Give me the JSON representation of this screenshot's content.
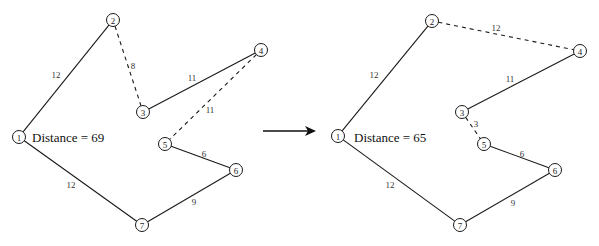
{
  "figure": {
    "width": 599,
    "height": 246,
    "arrow": {
      "x1": 263,
      "y1": 131,
      "x2": 316,
      "y2": 131
    }
  },
  "graphs": [
    {
      "id": "before",
      "distance_label": "Distance = 69",
      "distance_pos": {
        "x": 32,
        "y": 142
      },
      "nodes": [
        {
          "id": "1",
          "label": "1",
          "x": 19,
          "y": 137
        },
        {
          "id": "2",
          "label": "2",
          "x": 113,
          "y": 20
        },
        {
          "id": "3",
          "label": "3",
          "x": 143,
          "y": 112
        },
        {
          "id": "4",
          "label": "4",
          "x": 261,
          "y": 50
        },
        {
          "id": "5",
          "label": "5",
          "x": 165,
          "y": 144
        },
        {
          "id": "6",
          "label": "6",
          "x": 236,
          "y": 170
        },
        {
          "id": "7",
          "label": "7",
          "x": 142,
          "y": 225
        }
      ],
      "edges": [
        {
          "from": "1",
          "to": "2",
          "weight": "12",
          "style": "solid",
          "label_pos": {
            "x": 56,
            "y": 75
          }
        },
        {
          "from": "2",
          "to": "3",
          "weight": "8",
          "style": "dashed",
          "label_pos": {
            "x": 133,
            "y": 66
          }
        },
        {
          "from": "3",
          "to": "4",
          "weight": "11",
          "style": "solid",
          "label_pos": {
            "x": 192,
            "y": 78
          }
        },
        {
          "from": "4",
          "to": "5",
          "weight": "11",
          "style": "dashed",
          "label_pos": {
            "x": 210,
            "y": 110
          }
        },
        {
          "from": "5",
          "to": "6",
          "weight": "6",
          "style": "solid",
          "label_pos": {
            "x": 204,
            "y": 154
          }
        },
        {
          "from": "6",
          "to": "7",
          "weight": "9",
          "style": "solid",
          "label_pos": {
            "x": 194,
            "y": 202
          }
        },
        {
          "from": "7",
          "to": "1",
          "weight": "12",
          "style": "solid",
          "label_pos": {
            "x": 71,
            "y": 185
          }
        }
      ]
    },
    {
      "id": "after",
      "distance_label": "Distance = 65",
      "distance_pos": {
        "x": 354,
        "y": 142
      },
      "nodes": [
        {
          "id": "1",
          "label": "1",
          "x": 338,
          "y": 136
        },
        {
          "id": "2",
          "label": "2",
          "x": 432,
          "y": 21
        },
        {
          "id": "3",
          "label": "3",
          "x": 462,
          "y": 112
        },
        {
          "id": "4",
          "label": "4",
          "x": 580,
          "y": 51
        },
        {
          "id": "5",
          "label": "5",
          "x": 484,
          "y": 144
        },
        {
          "id": "6",
          "label": "6",
          "x": 555,
          "y": 170
        },
        {
          "id": "7",
          "label": "7",
          "x": 460,
          "y": 225
        }
      ],
      "edges": [
        {
          "from": "1",
          "to": "2",
          "weight": "12",
          "style": "solid",
          "label_pos": {
            "x": 374,
            "y": 75
          }
        },
        {
          "from": "2",
          "to": "4",
          "weight": "12",
          "style": "dashed",
          "label_pos": {
            "x": 496,
            "y": 28
          }
        },
        {
          "from": "4",
          "to": "3",
          "weight": "11",
          "style": "solid",
          "label_pos": {
            "x": 510,
            "y": 79
          }
        },
        {
          "from": "3",
          "to": "5",
          "weight": "3",
          "style": "dashed",
          "label_pos": {
            "x": 476,
            "y": 124
          }
        },
        {
          "from": "5",
          "to": "6",
          "weight": "6",
          "style": "solid",
          "label_pos": {
            "x": 522,
            "y": 154
          }
        },
        {
          "from": "6",
          "to": "7",
          "weight": "9",
          "style": "solid",
          "label_pos": {
            "x": 513,
            "y": 203
          }
        },
        {
          "from": "7",
          "to": "1",
          "weight": "12",
          "style": "solid",
          "label_pos": {
            "x": 390,
            "y": 185
          }
        }
      ]
    }
  ]
}
